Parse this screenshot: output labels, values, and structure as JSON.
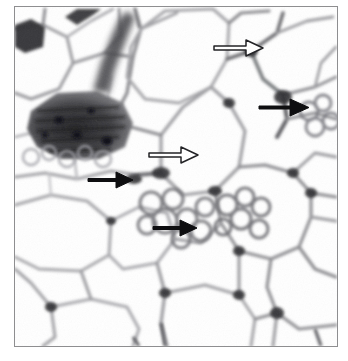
{
  "figure": {
    "domain": "Natural-Image",
    "kind": "histology-micrograph",
    "title": "Histological section of adipose tissue",
    "stain": "hematoxylin and eosin",
    "frame": {
      "border_color": "#8e8e90",
      "border_width_px": 1,
      "x": 14,
      "y": 6,
      "width": 324,
      "height": 341
    },
    "background_color": "#ffffff",
    "tissue_colors": {
      "lipid_droplet_white": "#ffffff",
      "septa_light_gray": "#cfcfd2",
      "septa_mid_gray": "#9a9a9e",
      "septa_dark_gray": "#5a5a5e",
      "nuclei_dark": "#2b2b2e",
      "dense_cluster_dark": "#3a3a3d"
    }
  },
  "annotations": {
    "arrows": [
      {
        "id": "arrow-1",
        "style": "outlined-white",
        "label": "open arrow upper right",
        "x1": 213,
        "y1": 45,
        "x2": 262,
        "y2": 45,
        "head": 11,
        "shaft": 4,
        "fill": "#ffffff",
        "stroke": "#2b2b2e",
        "stroke_width": 1.4
      },
      {
        "id": "arrow-2",
        "style": "solid-black",
        "label": "filled arrow right side",
        "x1": 258,
        "y1": 105,
        "x2": 307,
        "y2": 105,
        "head": 13,
        "shaft": 5,
        "fill": "#111113",
        "stroke": "#111113",
        "stroke_width": 0
      },
      {
        "id": "arrow-3",
        "style": "outlined-white",
        "label": "open arrow centre",
        "x1": 148,
        "y1": 152,
        "x2": 196,
        "y2": 152,
        "head": 11,
        "shaft": 4,
        "fill": "#ffffff",
        "stroke": "#2b2b2e",
        "stroke_width": 1.4
      },
      {
        "id": "arrow-4",
        "style": "solid-black",
        "label": "filled arrow left centre",
        "x1": 87,
        "y1": 179,
        "x2": 131,
        "y2": 179,
        "head": 12,
        "shaft": 4,
        "fill": "#111113",
        "stroke": "#111113",
        "stroke_width": 0
      },
      {
        "id": "arrow-5",
        "style": "solid-black",
        "label": "filled arrow lower centre",
        "x1": 152,
        "y1": 227,
        "x2": 194,
        "y2": 227,
        "head": 12,
        "shaft": 4,
        "fill": "#111113",
        "stroke": "#111113",
        "stroke_width": 0
      }
    ]
  },
  "structures": {
    "dense_region": {
      "name": "dark-stained-cluster",
      "location": "upper-left",
      "description": "densely stained multilocular / vascular cluster"
    },
    "adipocytes_note": "large unilocular white adipocytes separated by thin gray septa",
    "multilocular_note": "clusters of small multilocular cells in centre and right-centre"
  }
}
